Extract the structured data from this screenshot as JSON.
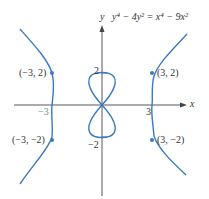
{
  "figure": {
    "equation": "y⁴ − 4y² = x⁴ − 9x²",
    "axes": {
      "x_label": "x",
      "y_label": "y"
    },
    "ticks": {
      "x_neg": "−3",
      "x_pos": "3",
      "y_pos": "2",
      "y_neg": "−2"
    },
    "points": [
      {
        "label": "(−3, 2)",
        "x": -3,
        "y": 2
      },
      {
        "label": "(3, 2)",
        "x": 3,
        "y": 2
      },
      {
        "label": "(−3, −2)",
        "x": -3,
        "y": -2
      },
      {
        "label": "(3, −2)",
        "x": 3,
        "y": -2
      }
    ],
    "colors": {
      "curve": "#3a78c2",
      "axis": "#444444",
      "text": "#333333"
    }
  }
}
